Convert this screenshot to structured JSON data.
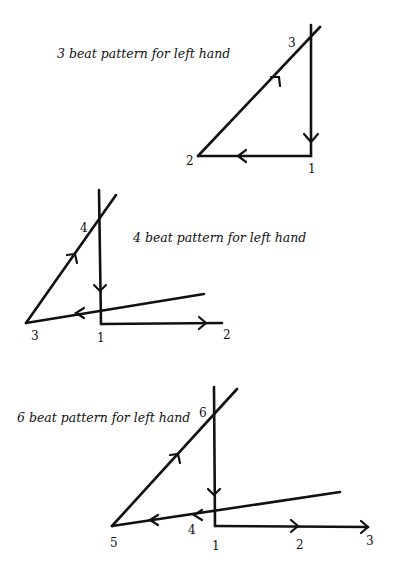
{
  "diagrams": [
    {
      "caption": "3 beat pattern for left hand",
      "beats": [
        "1",
        "2",
        "3"
      ]
    },
    {
      "caption": "4 beat pattern for left hand",
      "beats": [
        "1",
        "2",
        "3",
        "4"
      ]
    },
    {
      "caption": "6 beat pattern for left hand",
      "beats": [
        "1",
        "2",
        "3",
        "4",
        "5",
        "6"
      ]
    }
  ]
}
